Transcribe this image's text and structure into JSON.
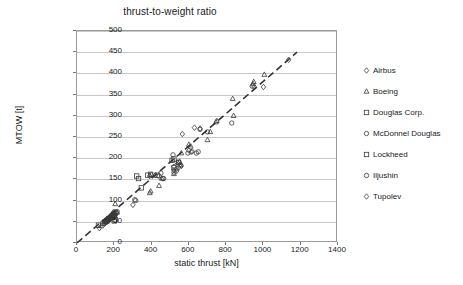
{
  "chart_data": {
    "type": "scatter",
    "title": "thrust-to-weight ratio",
    "xlabel": "static thrust [kN]",
    "ylabel": "MTOW [t]",
    "xlim": [
      0,
      1400
    ],
    "ylim": [
      0,
      500
    ],
    "xticks": [
      0,
      200,
      400,
      600,
      800,
      1000,
      1200,
      1400
    ],
    "yticks": [
      0,
      50,
      100,
      150,
      200,
      250,
      300,
      350,
      400,
      450,
      500
    ],
    "grid": "horizontal",
    "legend_position": "right",
    "trendline": {
      "style": "dashed",
      "color": "#333333",
      "x": [
        0,
        1180
      ],
      "y": [
        0,
        450
      ]
    },
    "series": [
      {
        "name": "Airbus",
        "marker": "diamond",
        "points": [
          [
            120,
            35
          ],
          [
            150,
            48
          ],
          [
            160,
            52
          ],
          [
            168,
            58
          ],
          [
            175,
            62
          ],
          [
            185,
            66
          ],
          [
            196,
            73
          ],
          [
            205,
            70
          ],
          [
            300,
            90
          ],
          [
            390,
            158
          ],
          [
            400,
            160
          ],
          [
            420,
            160
          ],
          [
            520,
            180
          ],
          [
            535,
            175
          ],
          [
            545,
            178
          ],
          [
            555,
            185
          ],
          [
            560,
            182
          ],
          [
            565,
            257
          ],
          [
            600,
            218
          ],
          [
            612,
            215
          ],
          [
            618,
            216
          ],
          [
            630,
            272
          ],
          [
            660,
            270
          ],
          [
            950,
            368
          ],
          [
            1000,
            368
          ],
          [
            1135,
            432
          ]
        ]
      },
      {
        "name": "Boeing",
        "marker": "triangle",
        "points": [
          [
            130,
            40
          ],
          [
            155,
            50
          ],
          [
            165,
            55
          ],
          [
            175,
            58
          ],
          [
            190,
            63
          ],
          [
            200,
            68
          ],
          [
            205,
            92
          ],
          [
            215,
            72
          ],
          [
            390,
            118
          ],
          [
            395,
            122
          ],
          [
            440,
            135
          ],
          [
            455,
            152
          ],
          [
            520,
            163
          ],
          [
            540,
            190
          ],
          [
            550,
            192
          ],
          [
            555,
            183
          ],
          [
            560,
            212
          ],
          [
            600,
            232
          ],
          [
            610,
            228
          ],
          [
            700,
            243
          ],
          [
            715,
            262
          ],
          [
            745,
            285
          ],
          [
            750,
            288
          ],
          [
            835,
            340
          ],
          [
            840,
            300
          ],
          [
            945,
            375
          ],
          [
            948,
            380
          ],
          [
            1005,
            397
          ]
        ]
      },
      {
        "name": "Douglas Corp.",
        "marker": "square",
        "points": [
          [
            115,
            42
          ],
          [
            140,
            46
          ],
          [
            150,
            50
          ],
          [
            160,
            52
          ],
          [
            170,
            56
          ],
          [
            180,
            60
          ],
          [
            190,
            64
          ],
          [
            200,
            52
          ],
          [
            205,
            55
          ],
          [
            320,
            158
          ],
          [
            330,
            152
          ],
          [
            345,
            130
          ],
          [
            380,
            160
          ],
          [
            395,
            162
          ],
          [
            430,
            160
          ],
          [
            520,
            178
          ],
          [
            545,
            190
          ]
        ]
      },
      {
        "name": "McDonnel Douglas",
        "marker": "circle",
        "points": [
          [
            175,
            60
          ],
          [
            185,
            65
          ],
          [
            195,
            68
          ],
          [
            200,
            62
          ],
          [
            210,
            70
          ],
          [
            215,
            74
          ],
          [
            310,
            102
          ],
          [
            315,
            100
          ],
          [
            450,
            165
          ],
          [
            460,
            152
          ],
          [
            515,
            208
          ],
          [
            595,
            212
          ],
          [
            640,
            212
          ],
          [
            650,
            215
          ],
          [
            660,
            268
          ],
          [
            700,
            262
          ],
          [
            830,
            283
          ],
          [
            940,
            370
          ]
        ]
      },
      {
        "name": "Lockheed",
        "marker": "square",
        "points": [
          [
            160,
            53
          ],
          [
            172,
            58
          ],
          [
            190,
            60
          ],
          [
            198,
            66
          ],
          [
            510,
            195
          ],
          [
            520,
            198
          ]
        ]
      },
      {
        "name": "Iljushin",
        "marker": "circle",
        "points": [
          [
            155,
            50
          ],
          [
            168,
            54
          ],
          [
            180,
            58
          ],
          [
            192,
            62
          ],
          [
            205,
            66
          ],
          [
            440,
            158
          ],
          [
            465,
            152
          ],
          [
            520,
            167
          ]
        ]
      },
      {
        "name": "Tupolev",
        "marker": "diamond",
        "points": [
          [
            148,
            45
          ],
          [
            160,
            50
          ],
          [
            172,
            55
          ],
          [
            185,
            58
          ],
          [
            196,
            63
          ],
          [
            200,
            68
          ],
          [
            212,
            72
          ],
          [
            520,
            172
          ],
          [
            535,
            170
          ]
        ]
      }
    ]
  },
  "legend": {
    "items": [
      {
        "label": "Airbus",
        "marker": "diamond"
      },
      {
        "label": "Boeing",
        "marker": "triangle"
      },
      {
        "label": "Douglas Corp.",
        "marker": "square"
      },
      {
        "label": "McDonnel Douglas",
        "marker": "circle"
      },
      {
        "label": "Lockheed",
        "marker": "square"
      },
      {
        "label": "Iljushin",
        "marker": "circle"
      },
      {
        "label": "Tupolev",
        "marker": "diamond"
      }
    ]
  }
}
